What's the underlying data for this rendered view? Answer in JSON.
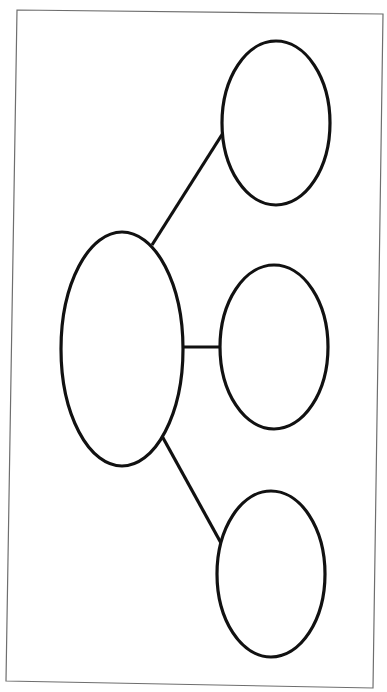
{
  "diagram": {
    "type": "web-organizer",
    "colors": {
      "background": "#ffffff",
      "frame_stroke": "#6e6e6e",
      "shape_stroke": "#111111"
    },
    "frame": {
      "points": "17,10 383,14 373,688 6,681"
    },
    "nodes": [
      {
        "id": "main",
        "label": "",
        "cx": 122,
        "cy": 349,
        "rx": 61,
        "ry": 117
      },
      {
        "id": "branch-top",
        "label": "",
        "cx": 276,
        "cy": 123,
        "rx": 54,
        "ry": 82
      },
      {
        "id": "branch-middle",
        "label": "",
        "cx": 274,
        "cy": 347,
        "rx": 54,
        "ry": 82
      },
      {
        "id": "branch-bottom",
        "label": "",
        "cx": 271,
        "cy": 574,
        "rx": 54,
        "ry": 83
      }
    ],
    "edges": [
      {
        "from": "main",
        "to": "branch-top",
        "x1": 152,
        "y1": 245,
        "x2": 223,
        "y2": 133
      },
      {
        "from": "main",
        "to": "branch-middle",
        "x1": 183,
        "y1": 347,
        "x2": 221,
        "y2": 347
      },
      {
        "from": "main",
        "to": "branch-bottom",
        "x1": 162,
        "y1": 436,
        "x2": 221,
        "y2": 543
      }
    ]
  }
}
